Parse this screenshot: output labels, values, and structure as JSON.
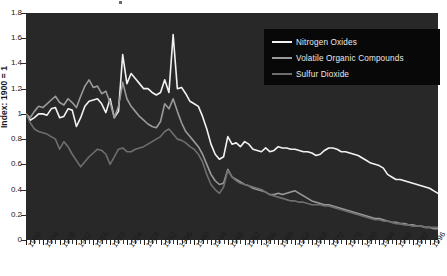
{
  "axes": {
    "y_label": "Index: 1900 = 1",
    "y_ticks": [
      "1.8",
      "1.6",
      "1.4",
      "1.2",
      "1",
      "0.8",
      "0.6",
      "0.4",
      "0.2",
      "0"
    ],
    "x_ticks": [
      "1900",
      "1904",
      "1908",
      "1912",
      "1916",
      "1920",
      "1924",
      "1928",
      "1932",
      "1936",
      "1940",
      "1944",
      "1948",
      "1952",
      "1956",
      "1960",
      "1964",
      "1968",
      "1972",
      "1976",
      "1980",
      "1984",
      "1988",
      "1992",
      "1996"
    ]
  },
  "legend": {
    "items": [
      {
        "label": "Nitrogen Oxides",
        "color": "#f2f2f2"
      },
      {
        "label": "Volatile Organic Compounds",
        "color": "#9a9a9a"
      },
      {
        "label": "Sulfur Dioxide",
        "color": "#6e6e6e"
      }
    ]
  },
  "style": {
    "plot_background": "#282828",
    "legend_background": "#080808",
    "page_background": "#ffffff",
    "axis_text_color": "#1a1a1a"
  },
  "chart_data": {
    "type": "line",
    "title": "",
    "xlabel": "",
    "ylabel": "Index: 1900 = 1",
    "xlim": [
      1900,
      1998
    ],
    "ylim": [
      0,
      1.8
    ],
    "ytick_step": 0.2,
    "xtick_step": 4,
    "grid": false,
    "legend_position": "top-right",
    "x": [
      1900,
      1901,
      1902,
      1903,
      1904,
      1905,
      1906,
      1907,
      1908,
      1909,
      1910,
      1911,
      1912,
      1913,
      1914,
      1915,
      1916,
      1917,
      1918,
      1919,
      1920,
      1921,
      1922,
      1923,
      1924,
      1925,
      1926,
      1927,
      1928,
      1929,
      1930,
      1931,
      1932,
      1933,
      1934,
      1935,
      1936,
      1937,
      1938,
      1939,
      1940,
      1941,
      1942,
      1943,
      1944,
      1945,
      1946,
      1947,
      1948,
      1949,
      1950,
      1951,
      1952,
      1953,
      1954,
      1955,
      1956,
      1957,
      1958,
      1959,
      1960,
      1961,
      1962,
      1963,
      1964,
      1965,
      1966,
      1967,
      1968,
      1969,
      1970,
      1971,
      1972,
      1973,
      1974,
      1975,
      1976,
      1977,
      1978,
      1979,
      1980,
      1981,
      1982,
      1983,
      1984,
      1985,
      1986,
      1987,
      1988,
      1989,
      1990,
      1991,
      1992,
      1993,
      1994,
      1995,
      1996,
      1997,
      1998
    ],
    "series": [
      {
        "name": "Nitrogen Oxides",
        "color": "#f2f2f2",
        "values": [
          1.0,
          0.95,
          0.97,
          1.0,
          1.0,
          0.99,
          1.04,
          1.05,
          0.97,
          0.98,
          1.04,
          1.03,
          0.9,
          0.97,
          1.06,
          1.1,
          1.11,
          1.12,
          1.08,
          1.01,
          1.12,
          0.97,
          1.02,
          1.47,
          1.24,
          1.32,
          1.28,
          1.24,
          1.2,
          1.2,
          1.17,
          1.15,
          1.17,
          1.27,
          1.17,
          1.63,
          1.2,
          1.21,
          1.16,
          1.1,
          1.08,
          1.06,
          0.98,
          0.88,
          0.76,
          0.68,
          0.64,
          0.66,
          0.82,
          0.76,
          0.77,
          0.74,
          0.78,
          0.76,
          0.72,
          0.71,
          0.7,
          0.73,
          0.7,
          0.71,
          0.74,
          0.73,
          0.73,
          0.72,
          0.72,
          0.71,
          0.7,
          0.7,
          0.69,
          0.67,
          0.68,
          0.71,
          0.73,
          0.73,
          0.72,
          0.7,
          0.7,
          0.69,
          0.68,
          0.67,
          0.65,
          0.63,
          0.61,
          0.6,
          0.59,
          0.57,
          0.52,
          0.5,
          0.48,
          0.48,
          0.47,
          0.46,
          0.45,
          0.44,
          0.43,
          0.42,
          0.41,
          0.39,
          0.37
        ]
      },
      {
        "name": "Volatile Organic Compounds",
        "color": "#9a9a9a",
        "values": [
          1.0,
          0.97,
          1.02,
          1.06,
          1.05,
          1.08,
          1.11,
          1.14,
          1.09,
          1.07,
          1.12,
          1.09,
          1.05,
          1.14,
          1.22,
          1.27,
          1.21,
          1.22,
          1.16,
          1.18,
          1.09,
          0.97,
          1.06,
          1.25,
          1.12,
          1.06,
          1.02,
          0.98,
          0.95,
          0.92,
          0.9,
          0.89,
          0.94,
          1.08,
          1.04,
          1.12,
          1.02,
          0.93,
          0.86,
          0.82,
          0.78,
          0.74,
          0.68,
          0.6,
          0.52,
          0.47,
          0.44,
          0.45,
          0.56,
          0.5,
          0.48,
          0.46,
          0.44,
          0.43,
          0.41,
          0.4,
          0.39,
          0.38,
          0.36,
          0.36,
          0.37,
          0.36,
          0.37,
          0.38,
          0.39,
          0.37,
          0.35,
          0.33,
          0.31,
          0.3,
          0.29,
          0.28,
          0.28,
          0.27,
          0.26,
          0.25,
          0.24,
          0.23,
          0.22,
          0.21,
          0.2,
          0.19,
          0.18,
          0.17,
          0.17,
          0.16,
          0.15,
          0.14,
          0.14,
          0.13,
          0.13,
          0.12,
          0.12,
          0.11,
          0.11,
          0.1,
          0.1,
          0.09,
          0.09
        ]
      },
      {
        "name": "Sulfur Dioxide",
        "color": "#6e6e6e",
        "values": [
          1.0,
          0.93,
          0.88,
          0.86,
          0.85,
          0.84,
          0.82,
          0.8,
          0.72,
          0.78,
          0.74,
          0.68,
          0.63,
          0.58,
          0.62,
          0.66,
          0.69,
          0.72,
          0.71,
          0.68,
          0.6,
          0.66,
          0.72,
          0.73,
          0.7,
          0.7,
          0.72,
          0.73,
          0.74,
          0.76,
          0.78,
          0.8,
          0.82,
          0.86,
          0.88,
          0.84,
          0.8,
          0.79,
          0.77,
          0.74,
          0.72,
          0.68,
          0.62,
          0.52,
          0.44,
          0.4,
          0.37,
          0.42,
          0.55,
          0.5,
          0.47,
          0.45,
          0.44,
          0.43,
          0.42,
          0.41,
          0.4,
          0.38,
          0.36,
          0.35,
          0.34,
          0.33,
          0.32,
          0.31,
          0.31,
          0.3,
          0.3,
          0.29,
          0.28,
          0.28,
          0.28,
          0.27,
          0.27,
          0.26,
          0.25,
          0.24,
          0.23,
          0.22,
          0.21,
          0.2,
          0.19,
          0.18,
          0.17,
          0.16,
          0.16,
          0.15,
          0.15,
          0.14,
          0.13,
          0.13,
          0.12,
          0.12,
          0.11,
          0.11,
          0.11,
          0.1,
          0.1,
          0.1,
          0.1
        ]
      }
    ]
  }
}
